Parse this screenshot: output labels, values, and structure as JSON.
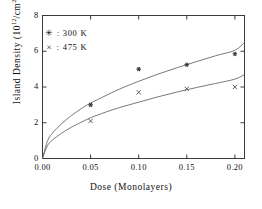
{
  "chart_data": {
    "type": "scatter",
    "title": "",
    "xlabel": "Dose  (Monolayers)",
    "ylabel_prefix": "Island  Density  (10",
    "ylabel_exp1": "12",
    "ylabel_mid": "/cm",
    "ylabel_exp2": "2",
    "ylabel_suffix": ")",
    "ylabel_plain": "Island Density (10^12 /cm^2)",
    "xlim": [
      0.0,
      0.21
    ],
    "ylim": [
      0,
      8
    ],
    "xticks": [
      0.0,
      0.05,
      0.1,
      0.15,
      0.2
    ],
    "xtick_labels": [
      "0.00",
      "0.05",
      "0.10",
      "0.15",
      "0.20"
    ],
    "yticks": [
      0,
      2,
      4,
      6,
      8
    ],
    "ytick_labels": [
      "0",
      "2",
      "4",
      "6",
      "8"
    ],
    "grid": false,
    "legend_position": "upper-left",
    "series": [
      {
        "name": "300 K",
        "legend_label": ": 300 K",
        "marker": "asterisk",
        "marker_glyph": "✳",
        "color": "#555555",
        "x": [
          0.05,
          0.1,
          0.15,
          0.2
        ],
        "values": [
          3.0,
          5.0,
          5.25,
          5.85
        ],
        "fit_curve": {
          "x": [
            0.0,
            0.005,
            0.01,
            0.02,
            0.03,
            0.04,
            0.05,
            0.065,
            0.08,
            0.1,
            0.12,
            0.14,
            0.16,
            0.18,
            0.2,
            0.21
          ],
          "y": [
            0.0,
            0.95,
            1.4,
            1.95,
            2.4,
            2.78,
            3.1,
            3.5,
            3.88,
            4.32,
            4.72,
            5.08,
            5.42,
            5.75,
            6.05,
            6.5
          ]
        }
      },
      {
        "name": "475 K",
        "legend_label": ": 475 K",
        "marker": "cross",
        "marker_glyph": "×",
        "color": "#777777",
        "x": [
          0.05,
          0.1,
          0.15,
          0.2
        ],
        "values": [
          2.1,
          3.7,
          3.9,
          4.0
        ],
        "fit_curve": {
          "x": [
            0.0,
            0.005,
            0.01,
            0.02,
            0.03,
            0.04,
            0.05,
            0.065,
            0.08,
            0.1,
            0.12,
            0.14,
            0.16,
            0.18,
            0.2,
            0.21
          ],
          "y": [
            0.0,
            0.7,
            1.02,
            1.42,
            1.75,
            2.02,
            2.28,
            2.58,
            2.85,
            3.15,
            3.45,
            3.72,
            3.97,
            4.2,
            4.44,
            4.7
          ]
        }
      }
    ]
  },
  "axes": {
    "frame_color": "#3a3a3a",
    "tick_color": "#3a3a3a"
  }
}
